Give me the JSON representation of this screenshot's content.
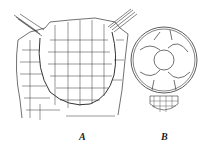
{
  "figure": {
    "panels": [
      {
        "label": "A",
        "description": "cross-section of cellular tissue with embedded chamber and two emerging tufts"
      },
      {
        "label": "B",
        "description": "round body containing large cells with small cellular base"
      }
    ],
    "line_color": "#333333",
    "background": "#ffffff"
  }
}
